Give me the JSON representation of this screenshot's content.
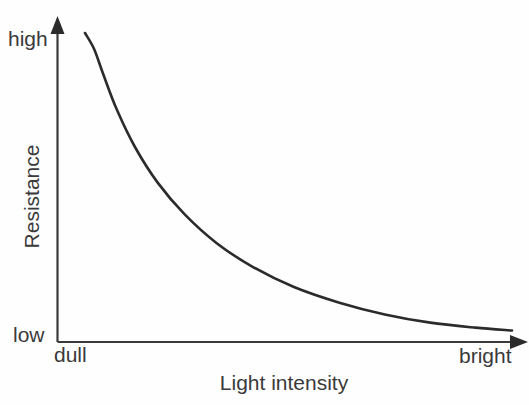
{
  "chart_data": {
    "type": "line",
    "title": "",
    "xlabel": "Light intensity",
    "ylabel": "Resistance",
    "x_tick_labels": [
      "dull",
      "bright"
    ],
    "y_tick_labels": [
      "low",
      "high"
    ],
    "grid": false,
    "legend": null,
    "axis_style": "arrow",
    "series": [
      {
        "name": "LDR resistance vs light intensity",
        "color": "#2b2b2b",
        "line_width": 2.6,
        "shape": "inverse-decay",
        "description": "Resistance falls steeply from high at dull light and flattens toward low at bright light",
        "x": [
          0.06,
          0.08,
          0.1,
          0.13,
          0.17,
          0.22,
          0.28,
          0.35,
          0.43,
          0.52,
          0.62,
          0.72,
          0.82,
          0.92,
          1.0
        ],
        "y": [
          0.975,
          0.93,
          0.86,
          0.76,
          0.655,
          0.555,
          0.465,
          0.385,
          0.318,
          0.262,
          0.218,
          0.185,
          0.162,
          0.148,
          0.14
        ]
      }
    ],
    "xlim": [
      0,
      1
    ],
    "ylim": [
      0,
      1
    ]
  },
  "colors": {
    "background": "#fefefe",
    "axis": "#3a3a3a",
    "curve": "#2b2b2b",
    "text": "#3a3a3a"
  }
}
